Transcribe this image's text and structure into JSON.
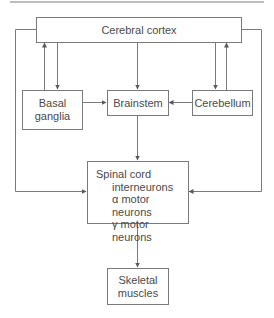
{
  "nodes": {
    "cortex": {
      "label": "Cerebral cortex"
    },
    "basal_ganglia": {
      "lines": [
        "Basal",
        "ganglia"
      ]
    },
    "brainstem": {
      "label": "Brainstem"
    },
    "cerebellum": {
      "label": "Cerebellum"
    },
    "spinal_cord": {
      "label": "Spinal cord",
      "items": [
        "interneurons",
        "α motor neurons",
        "γ motor neurons"
      ]
    },
    "skeletal_muscles": {
      "lines": [
        "Skeletal",
        "muscles"
      ]
    }
  },
  "edges": [
    {
      "from": "Cerebral cortex",
      "to": "Basal ganglia"
    },
    {
      "from": "Basal ganglia",
      "to": "Cerebral cortex"
    },
    {
      "from": "Cerebral cortex",
      "to": "Brainstem"
    },
    {
      "from": "Cerebral cortex",
      "to": "Cerebellum"
    },
    {
      "from": "Cerebellum",
      "to": "Cerebral cortex"
    },
    {
      "from": "Basal ganglia",
      "to": "Brainstem"
    },
    {
      "from": "Cerebellum",
      "to": "Brainstem"
    },
    {
      "from": "Brainstem",
      "to": "Spinal cord"
    },
    {
      "from": "Cerebral cortex",
      "to": "Spinal cord"
    },
    {
      "from": "Cerebral cortex",
      "to": "Spinal cord"
    },
    {
      "from": "Spinal cord",
      "to": "Skeletal muscles"
    }
  ],
  "colors": {
    "line": "#7a7a7a",
    "text": "#4a4a4a",
    "rule": "#bdbdbd"
  }
}
